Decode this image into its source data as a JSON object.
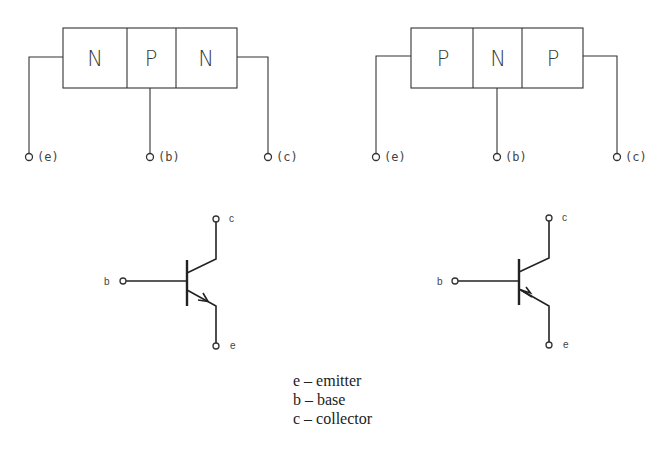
{
  "npn_block": {
    "regions": [
      "N",
      "P",
      "N"
    ],
    "terminals": {
      "emitter": "(e)",
      "base": "(b)",
      "collector": "(c)"
    }
  },
  "pnp_block": {
    "regions": [
      "P",
      "N",
      "P"
    ],
    "terminals": {
      "emitter": "(e)",
      "base": "(b)",
      "collector": "(c)"
    }
  },
  "npn_symbol": {
    "collector": "c",
    "base": "b",
    "emitter": "e",
    "arrow_direction": "out"
  },
  "pnp_symbol": {
    "collector": "c",
    "base": "b",
    "emitter": "e",
    "arrow_direction": "in"
  },
  "legend": [
    {
      "key": "e",
      "dash": "–",
      "meaning": "emitter"
    },
    {
      "key": "b",
      "dash": "–",
      "meaning": "base"
    },
    {
      "key": "c",
      "dash": "–",
      "meaning": "collector"
    }
  ]
}
